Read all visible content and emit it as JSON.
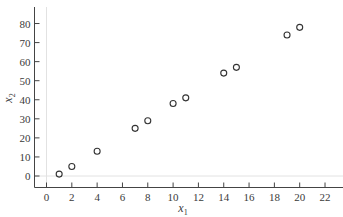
{
  "chart_data": {
    "type": "scatter",
    "title": "",
    "xlabel": "x1",
    "ylabel": "x2",
    "xlim": [
      -1,
      23.5
    ],
    "ylim": [
      -6,
      88
    ],
    "x_ticks": [
      0,
      2,
      4,
      6,
      8,
      10,
      12,
      14,
      16,
      18,
      20,
      22
    ],
    "y_ticks": [
      0,
      10,
      20,
      30,
      40,
      50,
      60,
      70,
      80
    ],
    "grid": false,
    "reference_lines": {
      "x": 0,
      "y": 0
    },
    "marker": "open-circle",
    "legend": null,
    "series": [
      {
        "name": "points",
        "x": [
          1,
          2,
          4,
          7,
          8,
          10,
          11,
          14,
          15,
          19,
          20
        ],
        "y": [
          1,
          5,
          13,
          25,
          29,
          38,
          41,
          54,
          57,
          74,
          78
        ]
      }
    ]
  },
  "labels": {
    "xlabel_main": "x",
    "xlabel_sub": "1",
    "ylabel_main": "x",
    "ylabel_sub": "2"
  }
}
